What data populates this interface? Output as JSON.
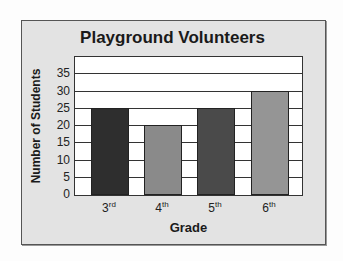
{
  "chart_data": {
    "type": "bar",
    "title": "Playground Volunteers",
    "xlabel": "Grade",
    "ylabel": "Number of Students",
    "categories": [
      "3rd",
      "4th",
      "5th",
      "6th"
    ],
    "category_display": [
      {
        "num": "3",
        "suffix": "rd"
      },
      {
        "num": "4",
        "suffix": "th"
      },
      {
        "num": "5",
        "suffix": "th"
      },
      {
        "num": "6",
        "suffix": "th"
      }
    ],
    "values": [
      25,
      20,
      25,
      30
    ],
    "colors": [
      "#2e2e2e",
      "#8a8a8a",
      "#4a4a4a",
      "#959595"
    ],
    "ylim": [
      0,
      40
    ],
    "yticks": [
      0,
      5,
      10,
      15,
      20,
      25,
      30,
      35
    ],
    "grid": true,
    "legend": null
  }
}
